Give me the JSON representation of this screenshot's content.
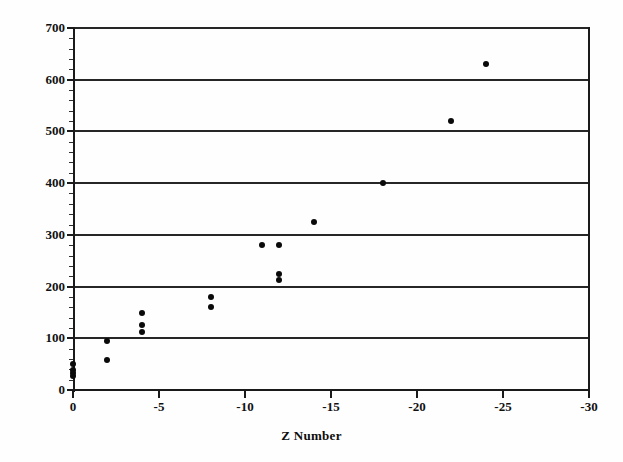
{
  "chart_data": {
    "type": "scatter",
    "title": "",
    "subtitle": "",
    "xlabel": "Z Number",
    "ylabel": "",
    "xlim": [
      0,
      -30
    ],
    "ylim": [
      0,
      700
    ],
    "x_ticks": [
      "0",
      "-5",
      "-10",
      "-15",
      "-20",
      "-25",
      "-30"
    ],
    "x_tick_values": [
      0,
      -5,
      -10,
      -15,
      -20,
      -25,
      -30
    ],
    "y_ticks": [
      "0",
      "100",
      "200",
      "300",
      "400",
      "500",
      "600",
      "700"
    ],
    "y_tick_values": [
      0,
      100,
      200,
      300,
      400,
      500,
      600,
      700
    ],
    "y_minor_tick_interval": 20,
    "grid": "horizontal",
    "legend": "none",
    "marker_style": "filled-circle",
    "marker_color": "#0a0a0a",
    "axis_color": "#1a1a1a",
    "gridline_color": "#262626",
    "background_color": "#fefefe",
    "points": [
      {
        "x": 0,
        "y": 50
      },
      {
        "x": 0,
        "y": 38
      },
      {
        "x": 0,
        "y": 33
      },
      {
        "x": 0,
        "y": 28
      },
      {
        "x": -2,
        "y": 95
      },
      {
        "x": -2,
        "y": 58
      },
      {
        "x": -4,
        "y": 148
      },
      {
        "x": -4,
        "y": 125
      },
      {
        "x": -4,
        "y": 112
      },
      {
        "x": -8,
        "y": 180
      },
      {
        "x": -8,
        "y": 160
      },
      {
        "x": -11,
        "y": 280
      },
      {
        "x": -12,
        "y": 280
      },
      {
        "x": -12,
        "y": 225
      },
      {
        "x": -12,
        "y": 212
      },
      {
        "x": -14,
        "y": 325
      },
      {
        "x": -18,
        "y": 400
      },
      {
        "x": -22,
        "y": 520
      },
      {
        "x": -24,
        "y": 630
      }
    ]
  }
}
